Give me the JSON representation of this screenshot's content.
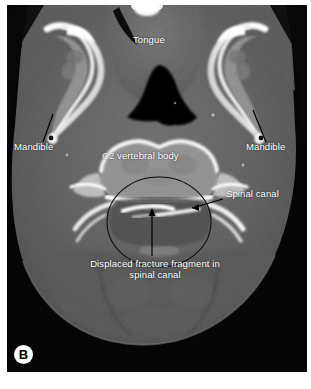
{
  "figure": {
    "panel_letter": "B",
    "modality": "axial CT",
    "background_color": "#ffffff",
    "plate_color": "#000000"
  },
  "annotations": [
    {
      "id": "tongue",
      "label": "Tongue",
      "x": 133,
      "y": 40,
      "leader": false
    },
    {
      "id": "mandible-left",
      "label": "Mandible",
      "x": 14,
      "y": 146,
      "leader": true
    },
    {
      "id": "mandible-right",
      "label": "Mandible",
      "x": 246,
      "y": 146,
      "leader": true
    },
    {
      "id": "c2-vertebral-body",
      "label": "C2 vertebral body",
      "x": 102,
      "y": 155,
      "leader": false
    },
    {
      "id": "spinal-canal",
      "label": "Spinal canal",
      "x": 226,
      "y": 193,
      "leader": true
    },
    {
      "id": "displaced-fracture-fragment",
      "label_line1": "Displaced fracture fragment in",
      "label_line2": "spinal canal",
      "x": 77,
      "y": 258,
      "leader": true
    }
  ],
  "colors": {
    "label_text": "#ffffff",
    "leader_line": "#000000",
    "panel_letter_bg": "#ffffff",
    "panel_letter_fg": "#000000",
    "soft_tissue": "#5a5a5a",
    "bone_bright": "#f2f2f2",
    "air_black": "#030303"
  }
}
